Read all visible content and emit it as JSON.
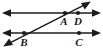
{
  "figure": {
    "background_color": "#ffffff",
    "stroke_color": "#1c1c1c",
    "label_color": "#1a1a1a",
    "width": 103,
    "height": 54,
    "lines": [
      {
        "name": "upper-parallel-line",
        "kind": "double-arrow-line",
        "x1": 3,
        "y1": 13,
        "x2": 100,
        "y2": 13,
        "arrow_start": true,
        "arrow_end": true
      },
      {
        "name": "lower-parallel-line",
        "kind": "double-arrow-line",
        "x1": 3,
        "y1": 33,
        "x2": 100,
        "y2": 33,
        "arrow_start": true,
        "arrow_end": true
      },
      {
        "name": "transversal-line",
        "kind": "double-arrow-line",
        "x1": 4,
        "y1": 46,
        "x2": 90,
        "y2": 2,
        "arrow_start": true,
        "arrow_end": true
      }
    ],
    "points": [
      {
        "name": "point-A",
        "label": "A",
        "x": 65,
        "y": 13,
        "label_x": 64,
        "label_y": 25
      },
      {
        "name": "point-D",
        "label": "D",
        "x": 78,
        "y": 13,
        "label_x": 77,
        "label_y": 25
      },
      {
        "name": "point-B",
        "label": "B",
        "x": 24,
        "y": 33,
        "label_x": 23,
        "label_y": 46
      },
      {
        "name": "point-C",
        "label": "C",
        "x": 79,
        "y": 33,
        "label_x": 78,
        "label_y": 46
      }
    ]
  }
}
